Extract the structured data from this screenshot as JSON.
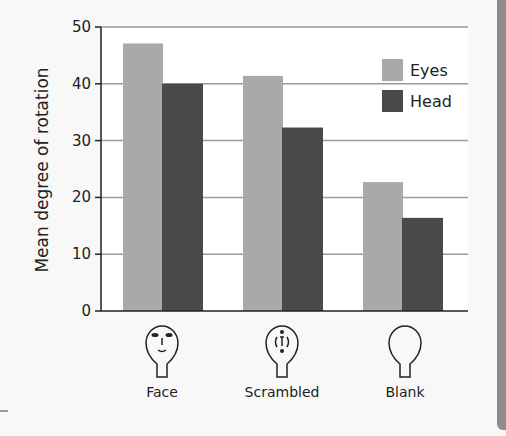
{
  "chart_data": {
    "type": "bar",
    "title": "",
    "xlabel": "",
    "ylabel": "Mean degree of rotation",
    "ylim": [
      0,
      50
    ],
    "yticks": [
      0,
      10,
      20,
      30,
      40,
      50
    ],
    "grid": true,
    "legend_position": "top-right",
    "categories": [
      "Face",
      "Scrambled",
      "Blank"
    ],
    "category_icons": [
      "face-stimulus-icon",
      "scrambled-face-stimulus-icon",
      "blank-head-stimulus-icon"
    ],
    "series": [
      {
        "name": "Eyes",
        "color": "#a9a9a9",
        "values": [
          47.1,
          41.4,
          22.7
        ]
      },
      {
        "name": "Head",
        "color": "#4a4a4a",
        "values": [
          40.0,
          32.3,
          16.4
        ]
      }
    ]
  },
  "colors": {
    "background": "#f8f8f8",
    "plot_background": "#ffffff",
    "gridline": "#9a9a9a",
    "axis": "#222222",
    "side_band": "#8e8e8e"
  }
}
